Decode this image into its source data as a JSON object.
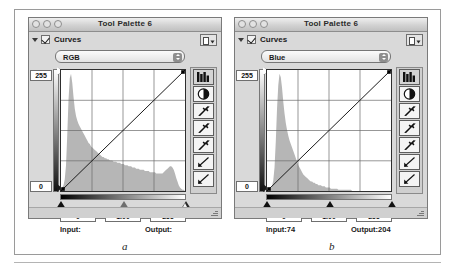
{
  "figure": {
    "caption_a": "a",
    "caption_b": "b"
  },
  "panels": [
    {
      "id": "panel-a",
      "window_title": "Tool Palette 6",
      "section_label": "Curves",
      "section_checked": true,
      "flyout_icon": "page-menu-icon",
      "channel_selected": "RGB",
      "channel_options": [
        "RGB",
        "Red",
        "Green",
        "Blue"
      ],
      "axis_top_label": "255",
      "axis_bottom_label": "0",
      "level_black": "0",
      "level_gamma": "1.00",
      "level_white": "255",
      "input_label": "Input:",
      "input_value": "",
      "output_label": "Output:",
      "output_value": "",
      "white_slider_filled": false,
      "tools": [
        "histogram-icon",
        "contrast-icon",
        "eyedropper-black-icon",
        "eyedropper-gray-icon",
        "eyedropper-white-icon",
        "curve-draw-icon",
        "curve-point-icon"
      ],
      "chart_data": {
        "type": "line",
        "title": "RGB Curves",
        "xlabel": "Input",
        "ylabel": "Output",
        "xlim": [
          0,
          255
        ],
        "ylim": [
          0,
          255
        ],
        "grid": true,
        "grid_divisions": 4,
        "curve_points": [
          [
            0,
            0
          ],
          [
            255,
            255
          ]
        ],
        "control_points": [
          [
            0,
            0
          ],
          [
            255,
            255
          ]
        ],
        "histogram": [
          2,
          3,
          5,
          10,
          22,
          48,
          78,
          96,
          100,
          92,
          80,
          70,
          64,
          60,
          57,
          55,
          53,
          51,
          49,
          47,
          45,
          43,
          41,
          40,
          38,
          37,
          36,
          35,
          34,
          33,
          32,
          31,
          30,
          29,
          29,
          28,
          28,
          27,
          27,
          26,
          26,
          26,
          25,
          25,
          25,
          24,
          24,
          24,
          23,
          23,
          23,
          22,
          22,
          22,
          21,
          21,
          21,
          20,
          20,
          20,
          19,
          19,
          19,
          18,
          18,
          18,
          18,
          17,
          17,
          17,
          17,
          16,
          16,
          16,
          16,
          16,
          15,
          15,
          15,
          15,
          15,
          15,
          16,
          17,
          18,
          19,
          20,
          21,
          21,
          20,
          18,
          15,
          11,
          8,
          5,
          3,
          2,
          1,
          1,
          0
        ]
      }
    },
    {
      "id": "panel-b",
      "window_title": "Tool Palette 6",
      "section_label": "Curves",
      "section_checked": true,
      "flyout_icon": "page-menu-icon",
      "channel_selected": "Blue",
      "channel_options": [
        "RGB",
        "Red",
        "Green",
        "Blue"
      ],
      "axis_top_label": "255",
      "axis_bottom_label": "0",
      "level_black": "0",
      "level_gamma": "1.00",
      "level_white": "255",
      "input_label": "Input:",
      "input_value": "74",
      "output_label": "Output:",
      "output_value": "204",
      "white_slider_filled": true,
      "tools": [
        "histogram-icon",
        "contrast-icon",
        "eyedropper-black-icon",
        "eyedropper-gray-icon",
        "eyedropper-white-icon",
        "curve-draw-icon",
        "curve-point-icon"
      ],
      "chart_data": {
        "type": "line",
        "title": "Blue Curves",
        "xlabel": "Input",
        "ylabel": "Output",
        "xlim": [
          0,
          255
        ],
        "ylim": [
          0,
          255
        ],
        "grid": true,
        "grid_divisions": 4,
        "curve_points": [
          [
            0,
            0
          ],
          [
            255,
            255
          ]
        ],
        "control_points": [
          [
            0,
            0
          ],
          [
            255,
            255
          ]
        ],
        "histogram": [
          0,
          0,
          1,
          2,
          4,
          9,
          20,
          42,
          70,
          90,
          100,
          97,
          88,
          76,
          66,
          58,
          52,
          47,
          43,
          40,
          37,
          34,
          31,
          28,
          25,
          22,
          20,
          18,
          16,
          14,
          13,
          12,
          11,
          10,
          9,
          8,
          8,
          7,
          7,
          6,
          6,
          5,
          5,
          5,
          4,
          4,
          4,
          3,
          3,
          3,
          3,
          2,
          2,
          2,
          2,
          2,
          2,
          1,
          1,
          1,
          1,
          1,
          1,
          1,
          1,
          1,
          1,
          1,
          0,
          0,
          0,
          0,
          0,
          0,
          0,
          0,
          0,
          0,
          0,
          0,
          0,
          0,
          0,
          0,
          0,
          0,
          0,
          0,
          0,
          0,
          0,
          0,
          0,
          0,
          0,
          0,
          0,
          0,
          0,
          0
        ]
      }
    }
  ]
}
